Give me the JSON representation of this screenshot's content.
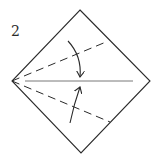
{
  "diagram": {
    "type": "origami-instruction-step",
    "step_number": "2",
    "colors": {
      "line": "#2a2a2a",
      "background": "#ffffff"
    },
    "square": {
      "orientation": "diamond",
      "vertices": {
        "top": [
          80,
          10
        ],
        "right": [
          150,
          81
        ],
        "bottom": [
          81,
          153
        ],
        "left": [
          12,
          81
        ]
      }
    },
    "center_crease": {
      "style": "solid-thin",
      "from": [
        25,
        81
      ],
      "to": [
        133,
        81
      ]
    },
    "valley_folds": [
      {
        "name": "upper-valley-fold",
        "style": "dashed",
        "from": [
          12,
          81
        ],
        "to": [
          106,
          42
        ]
      },
      {
        "name": "lower-valley-fold",
        "style": "dashed",
        "from": [
          12,
          81
        ],
        "to": [
          110,
          122
        ]
      }
    ],
    "fold_arrows": [
      {
        "name": "upper-fold-arrow",
        "direction": "down",
        "from": [
          68,
          41
        ],
        "to": [
          80,
          78
        ]
      },
      {
        "name": "lower-fold-arrow",
        "direction": "up",
        "from": [
          70,
          123
        ],
        "to": [
          80,
          86
        ]
      }
    ]
  }
}
